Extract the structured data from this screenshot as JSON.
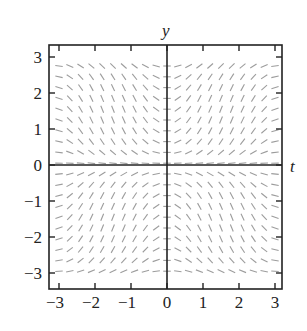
{
  "chart_data": {
    "type": "slope_field",
    "title": "",
    "xlabel": "t",
    "ylabel": "y",
    "xlim": [
      -3.25,
      3.25
    ],
    "ylim": [
      -3.25,
      3.25
    ],
    "x_ticks": [
      -3,
      -2,
      -1,
      0,
      1,
      2,
      3
    ],
    "y_ticks": [
      -3,
      -2,
      -1,
      0,
      1,
      2,
      3
    ],
    "x_tick_labels": [
      "−3",
      "−2",
      "−1",
      "0",
      "1",
      "2",
      "3"
    ],
    "y_tick_labels": [
      "−3",
      "−2",
      "−1",
      "0",
      "1",
      "2",
      "3"
    ],
    "grid": false,
    "legend": null,
    "field": {
      "description": "Slope field; slopes negative where t*y<0, positive where t*y>0, steepest near (t,y)=(±1.6,±1.7), nearly flat along axes and edges",
      "slope_model": "dy/dt ≈ 2.5·sin(t)·sin(y)",
      "amplitude": 2.5,
      "t_samples": {
        "start": -3.0,
        "step": 0.3,
        "count": 21
      },
      "y_samples": {
        "start": -2.95,
        "step": 0.3,
        "count": 20,
        "note": "rows at y = ±(0.25 + 0.3k), k=0..9"
      },
      "segment_length_px": 7.5
    }
  },
  "colors": {
    "frame": "#222222",
    "segments": "#9c9c9c",
    "background": "#ffffff"
  }
}
